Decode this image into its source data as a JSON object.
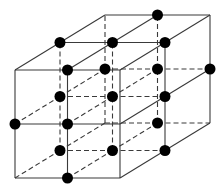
{
  "diagram": {
    "title": "",
    "colors": {
      "line": "#3a3a3a",
      "atom": "#000000",
      "background": "#ffffff"
    },
    "projection": {
      "origin": [
        15,
        178
      ],
      "dx": 52.5,
      "dy": -54,
      "depth_step": [
        45,
        -27.5
      ]
    },
    "grid_size": [
      2,
      2,
      2
    ],
    "atom_radius": 5.5,
    "atoms": [
      [
        1,
        0,
        0
      ],
      [
        0,
        1,
        0
      ],
      [
        1,
        1,
        0
      ],
      [
        1,
        2,
        0
      ],
      [
        0,
        2,
        1
      ],
      [
        1,
        2,
        1
      ],
      [
        2,
        2,
        1
      ],
      [
        0,
        1,
        1
      ],
      [
        1,
        1,
        1
      ],
      [
        2,
        1,
        1
      ],
      [
        0,
        0,
        1
      ],
      [
        1,
        0,
        1
      ],
      [
        2,
        0,
        1
      ],
      [
        1,
        2,
        2
      ],
      [
        1,
        1,
        2
      ],
      [
        2,
        1,
        2
      ],
      [
        0,
        1,
        2
      ],
      [
        1,
        0,
        2
      ]
    ]
  }
}
